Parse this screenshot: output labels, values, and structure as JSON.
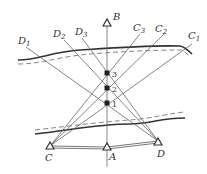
{
  "diagram": {
    "type": "survey-triangulation-across-river",
    "colors": {
      "line": "#555555",
      "bank": "#333333",
      "text": "#333333"
    },
    "stations": [
      {
        "id": "B",
        "label": "B",
        "x": 107,
        "y": 23
      },
      {
        "id": "A",
        "label": "A",
        "x": 107,
        "y": 146
      },
      {
        "id": "C",
        "label": "C",
        "x": 50,
        "y": 146
      },
      {
        "id": "D",
        "label": "D",
        "x": 158,
        "y": 141
      }
    ],
    "points": [
      {
        "label": "3",
        "x": 107,
        "y": 73
      },
      {
        "label": "2",
        "x": 107,
        "y": 88
      },
      {
        "label": "1",
        "x": 107,
        "y": 103
      }
    ],
    "sightlines": [
      {
        "base": "D",
        "sub": "1"
      },
      {
        "base": "D",
        "sub": "2"
      },
      {
        "base": "D",
        "sub": "3"
      },
      {
        "base": "C",
        "sub": "3"
      },
      {
        "base": "C",
        "sub": "2"
      },
      {
        "base": "C",
        "sub": "1"
      }
    ]
  }
}
